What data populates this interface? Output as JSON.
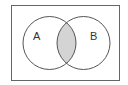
{
  "diagram": {
    "type": "venn",
    "sets": [
      {
        "label": "A"
      },
      {
        "label": "B"
      }
    ],
    "shaded_region": "A ∩ B",
    "colors": {
      "stroke": "#555555",
      "shade": "#d4d4d4",
      "background": "#ffffff"
    }
  }
}
